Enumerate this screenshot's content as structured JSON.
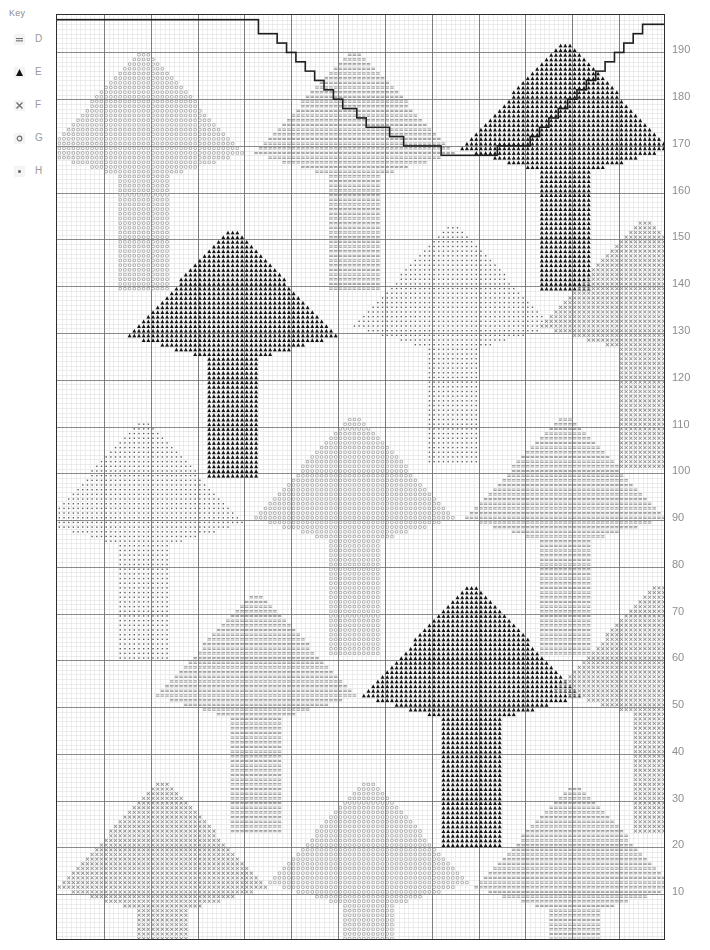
{
  "key": {
    "title": "Key",
    "entries": [
      {
        "symbol": "dash-symbol",
        "label": "D",
        "color": "#6f6f6f"
      },
      {
        "symbol": "triangle-symbol",
        "label": "E",
        "color": "#111111"
      },
      {
        "symbol": "cross-symbol",
        "label": "F",
        "color": "#6f6f6f"
      },
      {
        "symbol": "circle-symbol",
        "label": "G",
        "color": "#6f6f6f"
      },
      {
        "symbol": "dot-symbol",
        "label": "H",
        "color": "#4a4a4a"
      }
    ]
  },
  "axis": {
    "side": "right",
    "ticks": [
      190,
      180,
      170,
      160,
      150,
      140,
      130,
      120,
      110,
      100,
      90,
      80,
      70,
      60,
      50,
      40,
      30,
      20,
      10
    ]
  },
  "grid": {
    "cols": 130,
    "rows": 198,
    "cell_px": 4.68,
    "minor_color": "#d8d8d8",
    "major_color": "#6b6b6b",
    "major_every": 10,
    "border_color": "#2e2e2e"
  },
  "chart_data": {
    "type": "table",
    "symbol_colors": {
      "D": "#7d7d7d",
      "E": "#111111",
      "F": "#8a8a8a",
      "G": "#a0a0a0",
      "H": "#5a5a5a"
    },
    "arrow_shape_spec": {
      "description": "Up arrow: triangular head with flared barbs plus rectangular shaft",
      "head_rows": 22,
      "shaft_rows": 25,
      "shaft_half_width": 5,
      "head_half_width_max": 21,
      "barb_drop": 4
    },
    "motifs": [
      {
        "id": "r1c1",
        "symbol": "G",
        "col": 18,
        "row": 8,
        "scale": 1.0
      },
      {
        "id": "r1c2",
        "symbol": "D",
        "col": 63,
        "row": 8,
        "scale": 1.0
      },
      {
        "id": "r1c3",
        "symbol": "E",
        "col": 108,
        "row": 6,
        "scale": 1.05
      },
      {
        "id": "r2c1",
        "symbol": "E",
        "col": 37,
        "row": 46,
        "scale": 1.05
      },
      {
        "id": "r2c2",
        "symbol": "H",
        "col": 84,
        "row": 45,
        "scale": 1.0
      },
      {
        "id": "r2c3",
        "symbol": "F",
        "col": 125,
        "row": 44,
        "scale": 1.05
      },
      {
        "id": "r3c1",
        "symbol": "H",
        "col": 18,
        "row": 87,
        "scale": 1.0
      },
      {
        "id": "r3c2",
        "symbol": "G",
        "col": 63,
        "row": 86,
        "scale": 1.0
      },
      {
        "id": "r3c3",
        "symbol": "D",
        "col": 108,
        "row": 86,
        "scale": 1.0
      },
      {
        "id": "r4c1",
        "symbol": "D",
        "col": 42,
        "row": 124,
        "scale": 1.0
      },
      {
        "id": "r4c2",
        "symbol": "E",
        "col": 88,
        "row": 122,
        "scale": 1.1
      },
      {
        "id": "r4c3",
        "symbol": "F",
        "col": 128,
        "row": 122,
        "scale": 1.05
      },
      {
        "id": "r5c1",
        "symbol": "F",
        "col": 22,
        "row": 164,
        "scale": 1.05
      },
      {
        "id": "r5c2",
        "symbol": "G",
        "col": 66,
        "row": 164,
        "scale": 1.0
      },
      {
        "id": "r5c3",
        "symbol": "D",
        "col": 110,
        "row": 165,
        "scale": 1.0
      }
    ],
    "backstitch": {
      "color": "#1f1f1f",
      "width_px": 1.6,
      "points": [
        [
          0,
          1
        ],
        [
          43,
          1
        ],
        [
          43,
          4
        ],
        [
          47,
          4
        ],
        [
          47,
          6
        ],
        [
          49,
          6
        ],
        [
          49,
          8
        ],
        [
          51,
          8
        ],
        [
          51,
          10
        ],
        [
          53,
          10
        ],
        [
          53,
          12
        ],
        [
          55,
          12
        ],
        [
          55,
          14
        ],
        [
          57,
          14
        ],
        [
          57,
          16
        ],
        [
          59,
          16
        ],
        [
          59,
          18
        ],
        [
          61,
          18
        ],
        [
          61,
          20
        ],
        [
          64,
          20
        ],
        [
          64,
          22
        ],
        [
          66,
          22
        ],
        [
          66,
          24
        ],
        [
          71,
          24
        ],
        [
          71,
          26
        ],
        [
          74,
          26
        ],
        [
          74,
          28
        ],
        [
          82,
          28
        ],
        [
          82,
          30
        ],
        [
          94,
          30
        ],
        [
          94,
          28
        ],
        [
          101,
          28
        ],
        [
          101,
          26
        ],
        [
          103,
          26
        ],
        [
          103,
          24
        ],
        [
          105,
          24
        ],
        [
          105,
          22
        ],
        [
          107,
          22
        ],
        [
          107,
          20
        ],
        [
          109,
          20
        ],
        [
          109,
          18
        ],
        [
          111,
          18
        ],
        [
          111,
          16
        ],
        [
          113,
          16
        ],
        [
          113,
          14
        ],
        [
          115,
          14
        ],
        [
          115,
          12
        ],
        [
          117,
          12
        ],
        [
          117,
          10
        ],
        [
          119,
          10
        ],
        [
          119,
          8
        ],
        [
          121,
          8
        ],
        [
          121,
          6
        ],
        [
          123,
          6
        ],
        [
          123,
          4
        ],
        [
          125,
          4
        ],
        [
          125,
          2
        ],
        [
          130,
          2
        ]
      ]
    }
  }
}
